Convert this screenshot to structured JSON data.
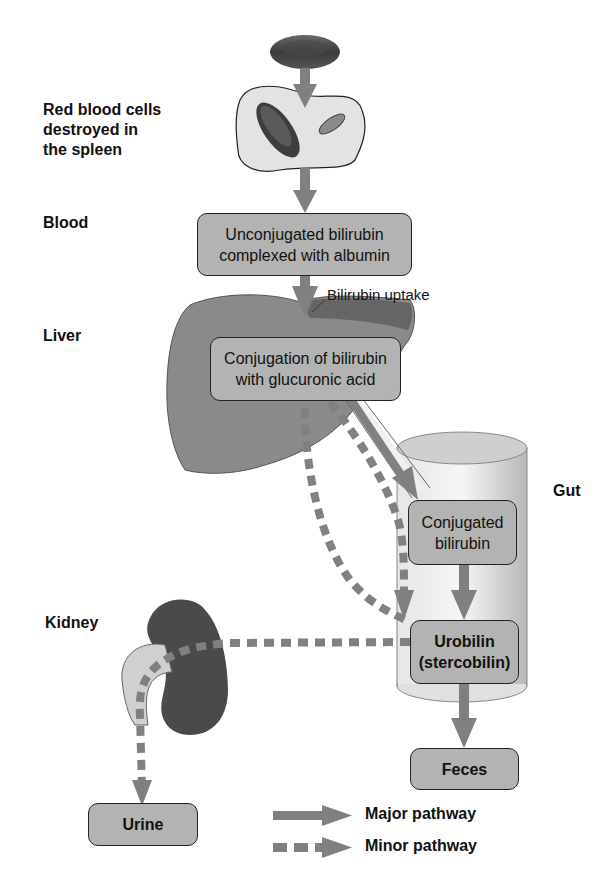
{
  "labels": {
    "spleen": "Red blood cells\ndestroyed in\nthe spleen",
    "blood": "Blood",
    "liver": "Liver",
    "gut": "Gut",
    "kidney": "Kidney"
  },
  "boxes": {
    "unconjugated": "Unconjugated bilirubin\ncomplexed with albumin",
    "conjugation": "Conjugation of bilirubin\nwith glucuronic acid",
    "conjugated": "Conjugated\nbilirubin",
    "urobilin": "Urobilin\n(stercobilin)",
    "feces": "Feces",
    "urine": "Urine"
  },
  "annotations": {
    "uptake": "Bilirubin uptake"
  },
  "legend": {
    "major": "Major pathway",
    "minor": "Minor pathway"
  },
  "colors": {
    "arrow": "#808080",
    "box_fill": "#b3b3b3",
    "organ_dark": "#555555",
    "organ_mid": "#8a8a8a",
    "organ_light": "#cfcfcf"
  }
}
